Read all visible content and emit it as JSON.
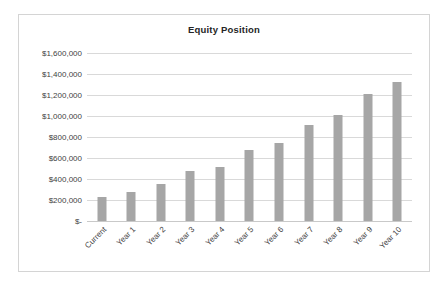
{
  "chart_data": {
    "type": "bar",
    "title": "Equity Position",
    "xlabel": "",
    "ylabel": "",
    "categories": [
      "Current",
      "Year 1",
      "Year 2",
      "Year 3",
      "Year 4",
      "Year 5",
      "Year 6",
      "Year 7",
      "Year 8",
      "Year 9",
      "Year 10"
    ],
    "values": [
      225000,
      275000,
      355000,
      480000,
      510000,
      680000,
      740000,
      915000,
      1005000,
      1210000,
      1320000
    ],
    "series": [
      {
        "name": "Equity Position",
        "values": [
          225000,
          275000,
          355000,
          480000,
          510000,
          680000,
          740000,
          915000,
          1005000,
          1210000,
          1320000
        ]
      }
    ],
    "ylim": [
      0,
      1600000
    ],
    "ytick_values": [
      1600000,
      1400000,
      1200000,
      1000000,
      800000,
      600000,
      400000,
      200000,
      0
    ],
    "ytick_labels": [
      "$1,600,000",
      "$1,400,000",
      "$1,200,000",
      "$1,000,000",
      "$800,000",
      "$600,000",
      "$400,000",
      "$200,000",
      "$-"
    ],
    "grid": true,
    "legend": false,
    "bar_color": "#a6a6a6",
    "gridline_color": "#d9d9d9",
    "text_color": "#3f3f3f",
    "title_color": "#262626",
    "border_color": "#d4d4d4",
    "background_color": "#ffffff"
  }
}
